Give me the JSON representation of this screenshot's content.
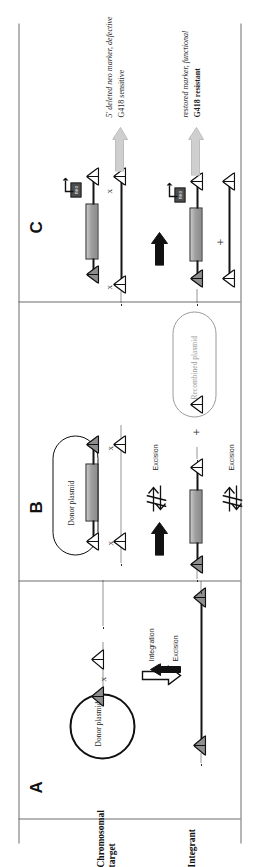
{
  "figure": {
    "panels": [
      {
        "id": "A",
        "letter": "A"
      },
      {
        "id": "B",
        "letter": "B"
      },
      {
        "id": "C",
        "letter": "C"
      }
    ],
    "row_labels": [
      {
        "id": "chromosomal-target",
        "line1": "Chromosomal",
        "line2": "target"
      },
      {
        "id": "integrant",
        "line1": "Integrant",
        "line2": ""
      }
    ]
  },
  "panelA": {
    "letter": "A",
    "donor_plasmid": "Donor plasmid",
    "integration_label": "Integration",
    "excision_label": "Excision"
  },
  "panelB": {
    "letter": "B",
    "donor_plasmid": "Donor plasmid",
    "recombined_plasmid": "Recombined plasmid",
    "excision_label_top": "Excision",
    "excision_label_bottom": "Excision"
  },
  "panelC": {
    "letter": "C",
    "marker_tag": "neo",
    "top_annotation_line1": "5' deleted neo marker, defective",
    "top_annotation_line2": "G418 sensitive",
    "bottom_annotation_line1": "restored marker, functional",
    "bottom_annotation_line2": "G418 resistant",
    "plus": "+"
  },
  "marks": {
    "crossover": "x",
    "plus": "+"
  },
  "colors": {
    "ink": "#151515",
    "rule": "#6d6d6d",
    "cassette_fill": "#9e9e9e",
    "gray_text": "#9a9a9a",
    "arrow_fill": "#111111"
  }
}
